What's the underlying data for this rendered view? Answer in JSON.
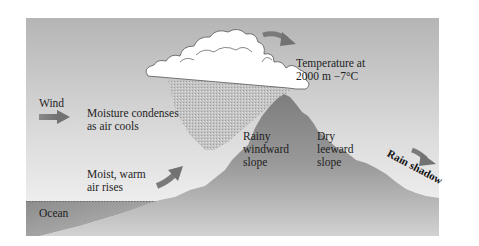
{
  "figure": {
    "colors": {
      "sky_top": "#b7b7b7",
      "sky_bottom": "#f4f4f4",
      "mountain": "#8e8e8e",
      "mountain_light": "#c9c9c9",
      "ocean": "#8a8a8a",
      "cloud": "#ffffff",
      "cloud_outline": "#555555",
      "arrow": "#7b7b7b",
      "text": "#1e1e1e"
    },
    "labels": {
      "wind": "Wind",
      "moisture": "Moisture condenses\nas air cools",
      "temperature": "Temperature at\n2000 m −7°C",
      "moist_air": "Moist, warm\nair rises",
      "rainy_slope": "Rainy\nwindward\nslope",
      "dry_slope": "Dry\nleeward\nslope",
      "rain_shadow": "Rain shadow",
      "ocean": "Ocean"
    },
    "arrows": [
      {
        "name": "wind-arrow",
        "direction": "right"
      },
      {
        "name": "rising-air-arrow",
        "direction": "up-right"
      },
      {
        "name": "over-cloud-arrow",
        "direction": "right-down"
      },
      {
        "name": "rain-shadow-arrow",
        "direction": "down-right"
      }
    ]
  }
}
